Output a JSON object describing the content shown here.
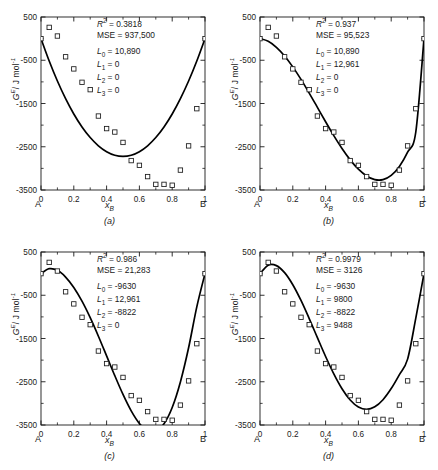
{
  "figure": {
    "axes": {
      "ylabel_symbol": "G",
      "ylabel_sup": "E",
      "ylabel_units": "/ J mol",
      "ylabel_units_sup": "-1",
      "xlabel_symbol": "x",
      "xlabel_sub": "B",
      "x_left_endmember": "A",
      "x_right_endmember": "B",
      "xticks": [
        "0",
        "0.2",
        "0.4",
        "0.6",
        "0.8",
        "1"
      ],
      "yticks": [
        "500",
        "-500",
        "-1500",
        "-2500",
        "-3500"
      ],
      "xlim": [
        0,
        1
      ],
      "ylim": [
        -3500,
        500
      ],
      "grid": false
    },
    "labels": {
      "r2": "R",
      "r2_sup": "2",
      "mse": "MSE",
      "L0": "L",
      "L0_sub": "0",
      "L1": "L",
      "L1_sub": "1",
      "L2": "L",
      "L2_sub": "2",
      "L3": "L",
      "L3_sub": "3",
      "equals": "="
    }
  },
  "chart_data": [
    {
      "id": "a",
      "type": "scatter",
      "caption": "(a)",
      "title": "",
      "xlabel": "x_B",
      "ylabel": "G^E / J mol^-1",
      "xlim": [
        0,
        1
      ],
      "ylim": [
        -3500,
        500
      ],
      "grid": false,
      "legend": "none",
      "stats": {
        "r2_value": "0.3818",
        "mse_value": "937,500",
        "L0_value": "10,890",
        "L1_value": "0",
        "L2_value": "0",
        "L3_value": "0"
      },
      "model": {
        "L0": 10890,
        "L1": 0,
        "L2": 0,
        "L3": 0
      },
      "series": [
        {
          "name": "experimental data",
          "marker": "open-square",
          "x": [
            0.0,
            0.05,
            0.1,
            0.15,
            0.2,
            0.25,
            0.3,
            0.35,
            0.4,
            0.45,
            0.5,
            0.55,
            0.6,
            0.65,
            0.7,
            0.75,
            0.8,
            0.85,
            0.9,
            0.95,
            1.0
          ],
          "y": [
            0,
            260,
            60,
            -420,
            -700,
            -1010,
            -1180,
            -1790,
            -2080,
            -2160,
            -2400,
            -2820,
            -2930,
            -3190,
            -3370,
            -3370,
            -3390,
            -3040,
            -2480,
            -1620,
            0
          ]
        },
        {
          "name": "fitted curve",
          "type": "line",
          "x": [
            0.0,
            0.05,
            0.1,
            0.15,
            0.2,
            0.25,
            0.3,
            0.35,
            0.4,
            0.45,
            0.5,
            0.55,
            0.6,
            0.65,
            0.7,
            0.75,
            0.8,
            0.85,
            0.9,
            0.95,
            1.0
          ],
          "y": [
            0,
            -517,
            -980,
            -1388,
            -1742,
            -2042,
            -2287,
            -2478,
            -2614,
            -2696,
            -2723,
            -2696,
            -2614,
            -2478,
            -2287,
            -2042,
            -1742,
            -1388,
            -980,
            -517,
            0
          ]
        }
      ]
    },
    {
      "id": "b",
      "type": "scatter",
      "caption": "(b)",
      "title": "",
      "xlabel": "x_B",
      "ylabel": "G^E / J mol^-1",
      "xlim": [
        0,
        1
      ],
      "ylim": [
        -3500,
        500
      ],
      "grid": false,
      "legend": "none",
      "stats": {
        "r2_value": "0.937",
        "mse_value": "95,523",
        "L0_value": "10,890",
        "L1_value": "12,961",
        "L2_value": "0",
        "L3_value": "0"
      },
      "model": {
        "L0": 10890,
        "L1": 12961,
        "L2": 0,
        "L3": 0
      },
      "series": [
        {
          "name": "experimental data",
          "marker": "open-square",
          "x": [
            0.0,
            0.05,
            0.1,
            0.15,
            0.2,
            0.25,
            0.3,
            0.35,
            0.4,
            0.45,
            0.5,
            0.55,
            0.6,
            0.65,
            0.7,
            0.75,
            0.8,
            0.85,
            0.9,
            0.95,
            1.0
          ],
          "y": [
            0,
            260,
            60,
            -420,
            -700,
            -1010,
            -1180,
            -1790,
            -2080,
            -2160,
            -2400,
            -2820,
            -2930,
            -3190,
            -3370,
            -3370,
            -3390,
            -3040,
            -2480,
            -1620,
            0
          ]
        },
        {
          "name": "fitted curve",
          "type": "line",
          "x": [
            0.0,
            0.05,
            0.1,
            0.15,
            0.2,
            0.25,
            0.3,
            0.35,
            0.4,
            0.45,
            0.5,
            0.55,
            0.6,
            0.65,
            0.7,
            0.75,
            0.8,
            0.85,
            0.9,
            0.95,
            1.0
          ],
          "y": [
            0,
            -61,
            -200,
            -401,
            -653,
            -943,
            -1259,
            -1589,
            -1921,
            -2242,
            -2540,
            -2803,
            -3019,
            -3175,
            -3259,
            -3259,
            -3161,
            -2954,
            -2624,
            -2159,
            0
          ]
        }
      ]
    },
    {
      "id": "c",
      "type": "scatter",
      "caption": "(c)",
      "title": "",
      "xlabel": "x_B",
      "ylabel": "G^E / J mol^-1",
      "xlim": [
        0,
        1
      ],
      "ylim": [
        -3500,
        500
      ],
      "grid": false,
      "legend": "none",
      "stats": {
        "r2_value": "0.986",
        "mse_value": "21,283",
        "L0_value": "-9630",
        "L1_value": "12,961",
        "L2_value": "-8822",
        "L3_value": "0"
      },
      "model": {
        "L0": -9630,
        "L1": 12961,
        "L2": -8822,
        "L3": 0
      },
      "series": [
        {
          "name": "experimental data",
          "marker": "open-square",
          "x": [
            0.0,
            0.05,
            0.1,
            0.15,
            0.2,
            0.25,
            0.3,
            0.35,
            0.4,
            0.45,
            0.5,
            0.55,
            0.6,
            0.65,
            0.7,
            0.75,
            0.8,
            0.85,
            0.9,
            0.95,
            1.0
          ],
          "y": [
            0,
            260,
            60,
            -420,
            -700,
            -1010,
            -1180,
            -1790,
            -2080,
            -2160,
            -2400,
            -2820,
            -2930,
            -3190,
            -3370,
            -3370,
            -3390,
            -3040,
            -2480,
            -1620,
            0
          ]
        },
        {
          "name": "fitted curve",
          "type": "line",
          "x": [
            0.0,
            0.05,
            0.1,
            0.15,
            0.2,
            0.25,
            0.3,
            0.35,
            0.4,
            0.45,
            0.5,
            0.55,
            0.6,
            0.65,
            0.7,
            0.75,
            0.8,
            0.85,
            0.9,
            0.95,
            1.0
          ],
          "y": [
            0,
            114,
            76,
            -79,
            -320,
            -638,
            -1019,
            -1447,
            -1902,
            -2360,
            -2794,
            -3174,
            -3465,
            -3634,
            -3646,
            -3473,
            -3095,
            -2504,
            -1714,
            -769,
            0
          ]
        }
      ]
    },
    {
      "id": "d",
      "type": "scatter",
      "caption": "(d)",
      "title": "",
      "xlabel": "x_B",
      "ylabel": "G^E / J mol^-1",
      "xlim": [
        0,
        1
      ],
      "ylim": [
        -3500,
        500
      ],
      "grid": false,
      "legend": "none",
      "stats": {
        "r2_value": "0.9979",
        "mse_value": "3126",
        "L0_value": "-9630",
        "L1_value": "9800",
        "L2_value": "-8822",
        "L3_value": "9488"
      },
      "model": {
        "L0": -9630,
        "L1": 9800,
        "L2": -8822,
        "L3": 9488
      },
      "series": [
        {
          "name": "experimental data",
          "marker": "open-square",
          "x": [
            0.0,
            0.05,
            0.1,
            0.15,
            0.2,
            0.25,
            0.3,
            0.35,
            0.4,
            0.45,
            0.5,
            0.55,
            0.6,
            0.65,
            0.7,
            0.75,
            0.8,
            0.85,
            0.9,
            0.95,
            1.0
          ],
          "y": [
            0,
            260,
            60,
            -420,
            -700,
            -1010,
            -1180,
            -1790,
            -2080,
            -2160,
            -2400,
            -2820,
            -2930,
            -3190,
            -3370,
            -3370,
            -3390,
            -3040,
            -2480,
            -1620,
            0
          ]
        },
        {
          "name": "fitted curve",
          "type": "line",
          "x": [
            0.0,
            0.05,
            0.1,
            0.15,
            0.2,
            0.25,
            0.3,
            0.35,
            0.4,
            0.45,
            0.5,
            0.55,
            0.6,
            0.65,
            0.7,
            0.75,
            0.8,
            0.85,
            0.9,
            0.95,
            1.0
          ],
          "y": [
            0,
            196,
            185,
            22,
            -257,
            -621,
            -1039,
            -1480,
            -1916,
            -2318,
            -2661,
            -2922,
            -3085,
            -3139,
            -3080,
            -2915,
            -2658,
            -2334,
            -1977,
            -1029,
            0
          ]
        }
      ]
    }
  ]
}
